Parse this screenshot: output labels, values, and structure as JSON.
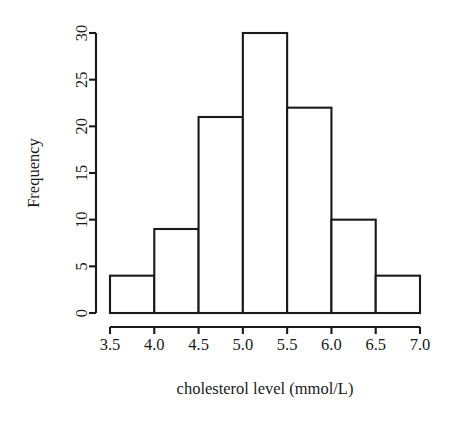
{
  "figure": {
    "width": 467,
    "height": 423,
    "background": "#ffffff",
    "foreground": "#1a1a1a"
  },
  "chart_data": {
    "type": "bar",
    "subtype": "histogram",
    "title": "",
    "xlabel": "cholesterol level (mmol/L)",
    "ylabel": "Frequency",
    "categories": [
      "3.5-4.0",
      "4.0-4.5",
      "4.5-5.0",
      "5.0-5.5",
      "5.5-6.0",
      "6.0-6.5",
      "6.5-7.0"
    ],
    "bin_edges": [
      3.5,
      4.0,
      4.5,
      5.0,
      5.5,
      6.0,
      6.5,
      7.0
    ],
    "bin_width": 0.5,
    "values": [
      4,
      9,
      21,
      30,
      22,
      10,
      4
    ],
    "total_count": 100,
    "xlim": [
      3.5,
      7.0
    ],
    "ylim": [
      0,
      30
    ],
    "xticks": [
      3.5,
      4.0,
      4.5,
      5.0,
      5.5,
      6.0,
      6.5,
      7.0
    ],
    "xtick_labels": [
      "3.5",
      "4.0",
      "4.5",
      "5.0",
      "5.5",
      "6.0",
      "6.5",
      "7.0"
    ],
    "yticks": [
      0,
      5,
      10,
      15,
      20,
      25,
      30
    ],
    "ytick_labels": [
      "0",
      "5",
      "10",
      "15",
      "20",
      "25",
      "30"
    ],
    "grid": false,
    "legend": null,
    "legend_position": "none",
    "bar_fill": "#ffffff",
    "bar_edge": "#1a1a1a",
    "ytick_label_rotation": 90
  }
}
